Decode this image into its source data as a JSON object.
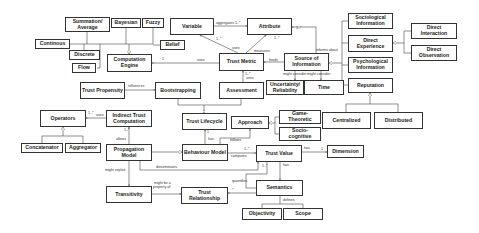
{
  "diagram": {
    "type": "UML class diagram (trust model meta-model)",
    "nodes": [
      {
        "id": "summation",
        "label": "Summation/ Average",
        "x": 65,
        "y": 17,
        "w": 45,
        "h": 15
      },
      {
        "id": "bayesian",
        "label": "Bayesian",
        "x": 111,
        "y": 18,
        "w": 30,
        "h": 10
      },
      {
        "id": "fuzzy",
        "label": "Fuzzy",
        "x": 142,
        "y": 18,
        "w": 22,
        "h": 10
      },
      {
        "id": "continuous",
        "label": "Continous",
        "x": 35,
        "y": 39,
        "w": 35,
        "h": 10
      },
      {
        "id": "discrete",
        "label": "Discrete",
        "x": 69,
        "y": 50,
        "w": 31,
        "h": 10
      },
      {
        "id": "flow",
        "label": "Flow",
        "x": 72,
        "y": 63,
        "w": 24,
        "h": 10
      },
      {
        "id": "belief",
        "label": "Belief",
        "x": 160,
        "y": 40,
        "w": 25,
        "h": 10
      },
      {
        "id": "variable",
        "label": "Variable",
        "x": 170,
        "y": 18,
        "w": 44,
        "h": 17
      },
      {
        "id": "attribute",
        "label": "Attribute",
        "x": 247,
        "y": 18,
        "w": 45,
        "h": 17
      },
      {
        "id": "comp_engine",
        "label": "Computation Engine",
        "x": 107,
        "y": 54,
        "w": 45,
        "h": 18
      },
      {
        "id": "trust_metric",
        "label": "Trust Metric",
        "x": 219,
        "y": 53,
        "w": 45,
        "h": 18
      },
      {
        "id": "source_info",
        "label": "Source of Information",
        "x": 284,
        "y": 53,
        "w": 45,
        "h": 18
      },
      {
        "id": "sociological",
        "label": "Sociological Information",
        "x": 348,
        "y": 13,
        "w": 45,
        "h": 16
      },
      {
        "id": "direct_exp",
        "label": "Direct Experience",
        "x": 348,
        "y": 35,
        "w": 45,
        "h": 17
      },
      {
        "id": "psychological",
        "label": "Psychological Information",
        "x": 348,
        "y": 57,
        "w": 45,
        "h": 16
      },
      {
        "id": "direct_inter",
        "label": "Direct Interaction",
        "x": 411,
        "y": 23,
        "w": 46,
        "h": 16
      },
      {
        "id": "direct_obs",
        "label": "Direct Observation",
        "x": 411,
        "y": 45,
        "w": 46,
        "h": 16
      },
      {
        "id": "reputation",
        "label": "Reputation",
        "x": 348,
        "y": 78,
        "w": 45,
        "h": 15
      },
      {
        "id": "centralized",
        "label": "Centralized",
        "x": 322,
        "y": 112,
        "w": 49,
        "h": 17
      },
      {
        "id": "distributed",
        "label": "Distributed",
        "x": 374,
        "y": 112,
        "w": 49,
        "h": 17
      },
      {
        "id": "uncertainty",
        "label": "Uncertainty/ Reliability",
        "x": 266,
        "y": 80,
        "w": 38,
        "h": 15
      },
      {
        "id": "time",
        "label": "Time",
        "x": 304,
        "y": 80,
        "w": 40,
        "h": 15
      },
      {
        "id": "trust_prop",
        "label": "Trust Propensity",
        "x": 80,
        "y": 82,
        "w": 45,
        "h": 17
      },
      {
        "id": "bootstrapping",
        "label": "Bootstrapping",
        "x": 155,
        "y": 82,
        "w": 46,
        "h": 17
      },
      {
        "id": "assessment",
        "label": "Assessment",
        "x": 219,
        "y": 82,
        "w": 45,
        "h": 17
      },
      {
        "id": "operators",
        "label": "Operators",
        "x": 40,
        "y": 110,
        "w": 46,
        "h": 17
      },
      {
        "id": "indirect_comp",
        "label": "Indirect Trust Computation",
        "x": 106,
        "y": 110,
        "w": 46,
        "h": 17
      },
      {
        "id": "trust_lifecycle",
        "label": "Trust Lifecycle",
        "x": 182,
        "y": 113,
        "w": 45,
        "h": 17
      },
      {
        "id": "approach",
        "label": "Approach",
        "x": 231,
        "y": 116,
        "w": 38,
        "h": 13
      },
      {
        "id": "game_theoretic",
        "label": "Game-Theoretic",
        "x": 279,
        "y": 110,
        "w": 42,
        "h": 14
      },
      {
        "id": "socio_cognitive",
        "label": "Socio-cognitive",
        "x": 279,
        "y": 127,
        "w": 42,
        "h": 14
      },
      {
        "id": "concatenator",
        "label": "Concatenator",
        "x": 21,
        "y": 143,
        "w": 42,
        "h": 10
      },
      {
        "id": "aggregator",
        "label": "Aggregator",
        "x": 65,
        "y": 143,
        "w": 36,
        "h": 10
      },
      {
        "id": "prop_model",
        "label": "Propagation Model",
        "x": 106,
        "y": 144,
        "w": 46,
        "h": 17
      },
      {
        "id": "behaviour_model",
        "label": "Behaviour Model",
        "x": 182,
        "y": 144,
        "w": 46,
        "h": 17
      },
      {
        "id": "trust_value",
        "label": "Trust Value",
        "x": 256,
        "y": 145,
        "w": 46,
        "h": 17
      },
      {
        "id": "dimension",
        "label": "Dimension",
        "x": 327,
        "y": 145,
        "w": 37,
        "h": 13
      },
      {
        "id": "transitivity",
        "label": "Transitivity",
        "x": 106,
        "y": 186,
        "w": 46,
        "h": 17
      },
      {
        "id": "trust_rel",
        "label": "Trust Relationship",
        "x": 181,
        "y": 187,
        "w": 47,
        "h": 17
      },
      {
        "id": "semantics",
        "label": "Semantics",
        "x": 256,
        "y": 180,
        "w": 47,
        "h": 16
      },
      {
        "id": "objectivity",
        "label": "Objectivity",
        "x": 242,
        "y": 208,
        "w": 40,
        "h": 12
      },
      {
        "id": "scope",
        "label": "Scope",
        "x": 283,
        "y": 208,
        "w": 40,
        "h": 12
      }
    ],
    "edge_labels": [
      {
        "text": "aggregates 1..*",
        "x": 216,
        "y": 22
      },
      {
        "text": "1..*",
        "x": 296,
        "y": 27
      },
      {
        "text": "1..*",
        "x": 216,
        "y": 38
      },
      {
        "text": "1..*",
        "x": 274,
        "y": 37
      },
      {
        "text": "uses",
        "x": 232,
        "y": 47
      },
      {
        "text": "measures",
        "x": 254,
        "y": 50
      },
      {
        "text": "informs about",
        "x": 316,
        "y": 49
      },
      {
        "text": "feeds",
        "x": 269,
        "y": 59
      },
      {
        "text": "uses",
        "x": 197,
        "y": 59
      },
      {
        "text": "1",
        "x": 162,
        "y": 58
      },
      {
        "text": "1..*",
        "x": 245,
        "y": 73
      },
      {
        "text": "uses",
        "x": 246,
        "y": 78
      },
      {
        "text": "might consider",
        "x": 285,
        "y": 74
      },
      {
        "text": "might consider",
        "x": 309,
        "y": 74
      },
      {
        "text": "influences",
        "x": 127,
        "y": 84
      },
      {
        "text": "1..*",
        "x": 89,
        "y": 111
      },
      {
        "text": "uses",
        "x": 96,
        "y": 114
      },
      {
        "text": "1..*",
        "x": 126,
        "y": 130
      },
      {
        "text": "allows",
        "x": 117,
        "y": 138
      },
      {
        "text": "1",
        "x": 209,
        "y": 132
      },
      {
        "text": "has",
        "x": 210,
        "y": 139
      },
      {
        "text": "follows",
        "x": 231,
        "y": 140
      },
      {
        "text": "1..*",
        "x": 244,
        "y": 146
      },
      {
        "text": "computes",
        "x": 232,
        "y": 157
      },
      {
        "text": "has",
        "x": 304,
        "y": 146
      },
      {
        "text": "1",
        "x": 321,
        "y": 151
      },
      {
        "text": "disseminates",
        "x": 158,
        "y": 167
      },
      {
        "text": "1..*",
        "x": 263,
        "y": 167
      },
      {
        "text": "has",
        "x": 283,
        "y": 167
      },
      {
        "text": "might exploit",
        "x": 105,
        "y": 171
      },
      {
        "text": "quantifies",
        "x": 236,
        "y": 179
      },
      {
        "text": "might be a",
        "x": 154,
        "y": 183
      },
      {
        "text": "property of",
        "x": 153,
        "y": 187
      },
      {
        "text": "*",
        "x": 233,
        "y": 188
      },
      {
        "text": "defines",
        "x": 282,
        "y": 201
      }
    ]
  }
}
